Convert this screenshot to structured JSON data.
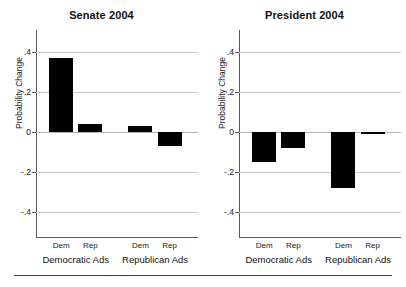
{
  "figure": {
    "ylabel": "Probability Change",
    "y_ticks": [
      ".4",
      ".2",
      "0",
      "-.2",
      "-.4"
    ],
    "group_labels": [
      "Democratic Ads",
      "Republican Ads"
    ],
    "bar_labels": [
      "Dem",
      "Rep",
      "Dem",
      "Rep"
    ],
    "bar_color": "#000000",
    "grid_color": "#c9c9c9",
    "axis_color": "#5a5a5a"
  },
  "chart_data": [
    {
      "type": "bar",
      "title": "Senate 2004",
      "xlabel": "",
      "ylabel": "Probability Change",
      "categories": [
        "Dem",
        "Rep",
        "Dem",
        "Rep"
      ],
      "groups": [
        "Democratic Ads",
        "Democratic Ads",
        "Republican Ads",
        "Republican Ads"
      ],
      "values": [
        0.37,
        0.04,
        0.03,
        -0.07
      ],
      "ylim": [
        -0.5,
        0.5
      ],
      "yticks": [
        0.4,
        0.2,
        0,
        -0.2,
        -0.4
      ],
      "ytick_labels": [
        ".4",
        ".2",
        "0",
        "-.2",
        "-.4"
      ],
      "grid": true,
      "legend": "none"
    },
    {
      "type": "bar",
      "title": "President 2004",
      "xlabel": "",
      "ylabel": "Probability Change",
      "categories": [
        "Dem",
        "Rep",
        "Dem",
        "Rep"
      ],
      "groups": [
        "Democratic Ads",
        "Democratic Ads",
        "Republican Ads",
        "Republican Ads"
      ],
      "values": [
        -0.15,
        -0.08,
        -0.28,
        -0.01
      ],
      "ylim": [
        -0.5,
        0.5
      ],
      "yticks": [
        0.4,
        0.2,
        0,
        -0.2,
        -0.4
      ],
      "ytick_labels": [
        ".4",
        ".2",
        "0",
        "-.2",
        "-.4"
      ],
      "grid": true,
      "legend": "none"
    }
  ]
}
